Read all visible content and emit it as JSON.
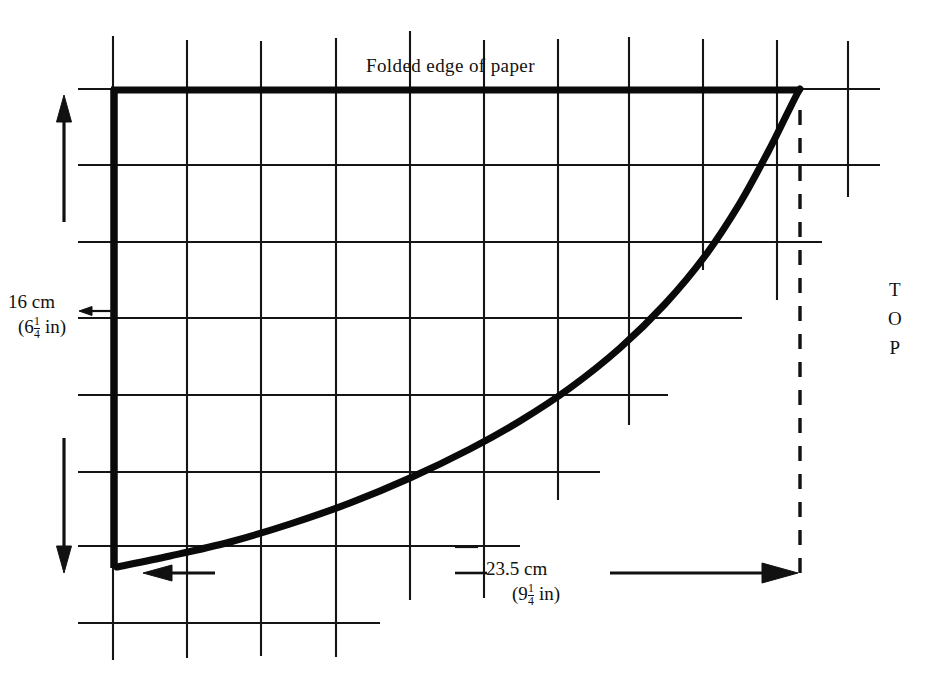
{
  "figure": {
    "kind": "technical-pattern-diagram",
    "background_color": "#ffffff",
    "ink_color": "#111111"
  },
  "labels": {
    "folded_edge": "Folded edge of paper",
    "orientation": {
      "line_1": "T",
      "line_2": "O",
      "line_3": "P"
    }
  },
  "dimensions": {
    "height": {
      "metric": "16 cm",
      "imperial_open": "(6",
      "imperial_whole": "6",
      "imperial_num": "1",
      "imperial_den": "4",
      "imperial_unit": " in)",
      "value_cm": 16,
      "value_in": 6.25,
      "orientation": "vertical"
    },
    "width": {
      "metric": "23.5 cm",
      "imperial_whole": "9",
      "imperial_num": "1",
      "imperial_den": "4",
      "imperial_unit": " in)",
      "value_cm": 23.5,
      "value_in": 9.25,
      "orientation": "horizontal"
    }
  },
  "grid": {
    "visible": true,
    "line_color": "#151515",
    "verticals_x": [
      113,
      187,
      261,
      336,
      410,
      484,
      558,
      629,
      703,
      777,
      848
    ],
    "horizontals_y": [
      89,
      165,
      242,
      318,
      395,
      472,
      546,
      623
    ],
    "cell_width_px": 74,
    "cell_height_px": 76
  },
  "chart_data": {
    "type": "line",
    "title": "Folded edge of paper",
    "xlabel": "23.5 cm (9 1/4 in)",
    "ylabel": "16 cm (6 1/4 in)",
    "grid": true,
    "legend": "none",
    "xlim": [
      0,
      23.5
    ],
    "ylim": [
      0,
      16
    ],
    "curve_points_px": [
      [
        117,
        567
      ],
      [
        170,
        556
      ],
      [
        230,
        542
      ],
      [
        290,
        524
      ],
      [
        350,
        503
      ],
      [
        410,
        478
      ],
      [
        470,
        449
      ],
      [
        520,
        421
      ],
      [
        570,
        388
      ],
      [
        620,
        348
      ],
      [
        665,
        304
      ],
      [
        705,
        256
      ],
      [
        740,
        203
      ],
      [
        768,
        152
      ],
      [
        786,
        116
      ],
      [
        797,
        94
      ],
      [
        800,
        89
      ]
    ],
    "bold_outline": {
      "left_edge_x_px": 113,
      "left_edge_y_from_px": 89,
      "left_edge_y_to_px": 567,
      "top_edge_y_px": 89,
      "top_edge_x_from_px": 113,
      "top_edge_x_to_px": 800
    },
    "dashed_guide": {
      "x_px": 800,
      "y_from_px": 110,
      "y_to_px": 575
    }
  }
}
